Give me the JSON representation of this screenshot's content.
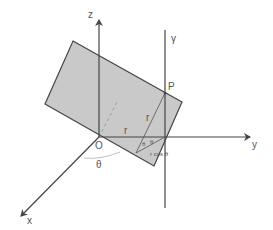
{
  "figure": {
    "colors": {
      "plane_fill": "#c9c9c9",
      "line": "#444444",
      "background": "#ffffff"
    }
  },
  "labels": {
    "z_axis": "z",
    "y_axis": "y",
    "x_axis": "x",
    "origin": "O",
    "line_gamma": "γ",
    "point_P": "P",
    "segment_r_plane": "r",
    "segment_r_slant": "r",
    "angle_theta_base": "θ",
    "angle_theta_a": "θ",
    "angle_theta_b": "θ",
    "r_cos_theta": "r cos θ"
  }
}
